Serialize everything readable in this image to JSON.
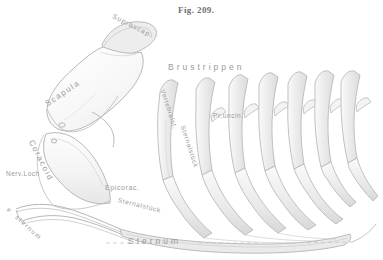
{
  "figure": {
    "caption": "Fig. 209.",
    "domain_note": "anatomical line illustration of avian shoulder girdle and thoracic ribs",
    "palette": {
      "background": "#ffffff",
      "outline": "#b9b9b9",
      "outline_dark": "#9a9a9a",
      "shading_light": "#f1f1f1",
      "shading_mid": "#e2e2e2",
      "shading_deep": "#d2d2d2",
      "label_text": "#9a9a9a",
      "caption_text": "#6f6f6f",
      "dashed_guide": "#c4c4c4"
    }
  },
  "labels": {
    "suprascapula": "Suprascap.",
    "scapula": "Scapula",
    "coracoid": "Coracoid",
    "nerve_foramen": "Nerv.Loch",
    "epicoracoid": "Epicorac.",
    "epicoracoid_sternal": "Sternalstück",
    "episternum": "e. sternum",
    "sternum": "Sternum",
    "thoracic_ribs": "Brustrippen",
    "vertebral_segment": "Vertebralst.",
    "sternal_segment": "Sternalstück",
    "uncinate_process": "Pr.uncin."
  },
  "anatomy": {
    "rib_count": 7,
    "parts": [
      "Suprascapula",
      "Scapula",
      "Coracoid",
      "Nerve foramen",
      "Epicoracoid",
      "Episternum",
      "Sternum",
      "Thoracic ribs",
      "Vertebral rib segment",
      "Sternal rib segment",
      "Uncinate process"
    ]
  }
}
